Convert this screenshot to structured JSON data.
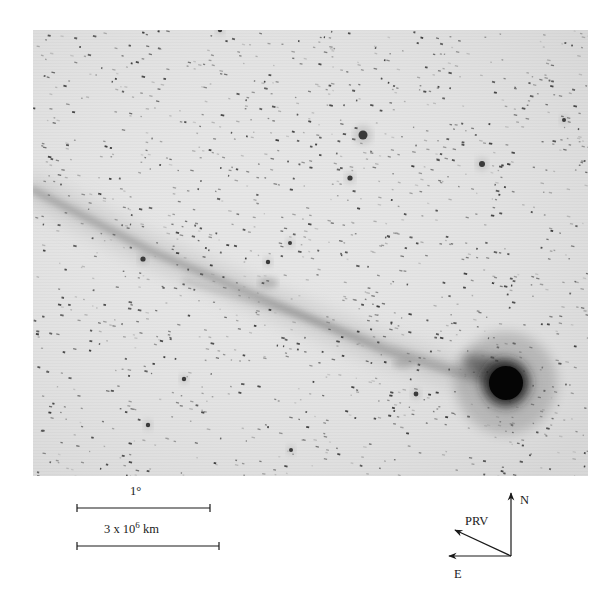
{
  "figure": {
    "type": "astronomical-photograph-negative",
    "photo": {
      "background_color": "#e6e6e6",
      "star_color": "#3a3a3a",
      "nucleus_color": "#050505",
      "tail_color": "#8a8a8a",
      "random_star_count": 1400,
      "random_seed": 7,
      "nucleus": {
        "x": 473,
        "y": 353,
        "r": 17
      },
      "tail_path": [
        [
          0,
          160
        ],
        [
          120,
          222
        ],
        [
          240,
          273
        ],
        [
          350,
          320
        ],
        [
          430,
          345
        ],
        [
          473,
          353
        ]
      ],
      "bright_stars": [
        {
          "x": 330,
          "y": 105,
          "r": 4.5
        },
        {
          "x": 449,
          "y": 134,
          "r": 3
        },
        {
          "x": 317,
          "y": 148,
          "r": 2.6
        },
        {
          "x": 110,
          "y": 229,
          "r": 2.6
        },
        {
          "x": 235,
          "y": 232,
          "r": 2.2
        },
        {
          "x": 187,
          "y": 0,
          "r": 2.2
        },
        {
          "x": 383,
          "y": 364,
          "r": 2.4
        },
        {
          "x": 115,
          "y": 395,
          "r": 2.2
        },
        {
          "x": 151,
          "y": 349,
          "r": 2.2
        },
        {
          "x": 257,
          "y": 213,
          "r": 2.0
        },
        {
          "x": 531,
          "y": 90,
          "r": 2.0
        },
        {
          "x": 258,
          "y": 420,
          "r": 2.0
        }
      ]
    },
    "scale_bars": [
      {
        "label": "1°",
        "x1": 77,
        "x2": 210,
        "y": 508,
        "label_x": 130,
        "label_y": 485
      },
      {
        "label_base": "3 x 10",
        "label_exp": "6",
        "label_unit": " km",
        "x1": 77,
        "x2": 219,
        "y": 546,
        "label_x": 104,
        "label_y": 523
      }
    ],
    "compass": {
      "origin": [
        511,
        556
      ],
      "arrows": [
        {
          "name": "N",
          "label": "N",
          "tip": [
            511,
            493
          ],
          "label_x": 520,
          "label_y": 494
        },
        {
          "name": "E",
          "label": "E",
          "tip": [
            449,
            556
          ],
          "label_x": 454,
          "label_y": 568
        },
        {
          "name": "PRV",
          "label": "PRV",
          "tip": [
            455,
            530
          ],
          "label_x": 465,
          "label_y": 515
        }
      ]
    }
  }
}
